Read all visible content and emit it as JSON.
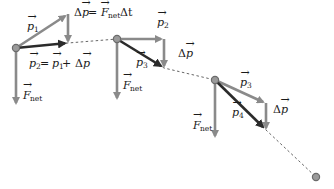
{
  "colors": {
    "light_arrow": "#8a8a8a",
    "dark_arrow": "#2b2b2b",
    "trajectory": "#555555",
    "point_fill": "#9a9a9a",
    "point_stroke": "#6b6b6b",
    "background": "#ffffff"
  },
  "labels": {
    "p1": {
      "base": "p",
      "sub": "1"
    },
    "p2_top": {
      "base": "p",
      "sub": "2"
    },
    "p2_eq": {
      "lhs_base": "p",
      "lhs_sub": "2",
      "eq": " = ",
      "r1_base": "p",
      "r1_sub": "1",
      "plus": " + ",
      "delta": "Δ",
      "r2_base": "p"
    },
    "impulse_eq": {
      "delta": "Δ",
      "lhs_base": "p",
      "eq": " = ",
      "f_base": "F",
      "f_sub": "net",
      "dt": " Δt"
    },
    "p3_a": {
      "base": "p",
      "sub": "3"
    },
    "p3_b": {
      "base": "p",
      "sub": "3"
    },
    "p4": {
      "base": "p",
      "sub": "4"
    },
    "dp2": {
      "delta": "Δ",
      "base": "p"
    },
    "dp3": {
      "delta": "Δ",
      "base": "p"
    },
    "fnet1": {
      "base": "F",
      "sub": "net"
    },
    "fnet2": {
      "base": "F",
      "sub": "net"
    },
    "fnet3": {
      "base": "F",
      "sub": "net"
    },
    "arrow_glyph": "→"
  },
  "icons": {
    "particle": "particle-dot-icon",
    "vector_arrow": "vector-arrow-icon"
  }
}
